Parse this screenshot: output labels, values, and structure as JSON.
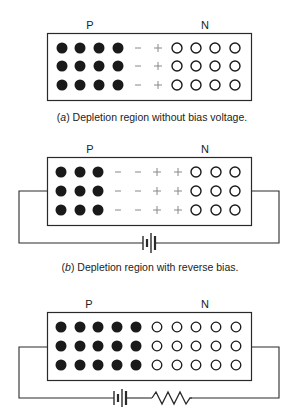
{
  "colors": {
    "stroke": "#2a2a2a",
    "hole_fill": "#1a1a1a",
    "charge_symbol": "#888888",
    "background": "#ffffff"
  },
  "panels": [
    {
      "id": "a",
      "p_label": "P",
      "n_label": "N",
      "caption_letter": "a",
      "caption_text": " Depletion region without bias voltage.",
      "p_side_holes_columns": 4,
      "depletion_minus_columns": 1,
      "depletion_plus_columns": 1,
      "n_side_electrons_columns": 4,
      "rows": 3,
      "circuit": "none"
    },
    {
      "id": "b",
      "p_label": "P",
      "n_label": "N",
      "caption_letter": "b",
      "caption_text": " Depletion region with reverse bias.",
      "p_side_holes_columns": 3,
      "depletion_minus_columns": 2,
      "depletion_plus_columns": 2,
      "n_side_electrons_columns": 3,
      "rows": 3,
      "circuit": "battery"
    },
    {
      "id": "c",
      "p_label": "P",
      "n_label": "N",
      "caption_letter": "",
      "caption_text": "",
      "p_side_holes_columns": 5,
      "depletion_minus_columns": 0,
      "depletion_plus_columns": 0,
      "n_side_electrons_columns": 5,
      "rows": 3,
      "circuit": "battery-resistor"
    }
  ],
  "symbols": {
    "minus": "−",
    "plus": "+"
  }
}
